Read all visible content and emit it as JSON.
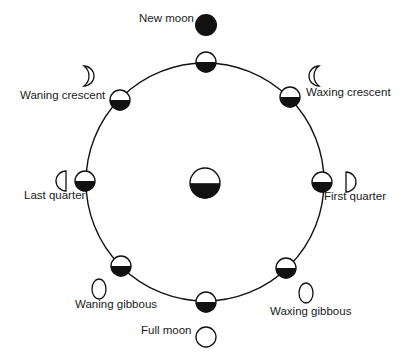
{
  "diagram": {
    "orbit": {
      "cx": 205,
      "cy": 182,
      "r": 119
    },
    "earth": {
      "cx": 205,
      "cy": 183,
      "r": 15
    },
    "colors": {
      "ink": "#111111",
      "background": "#ffffff"
    },
    "phases": [
      {
        "id": "new-moon",
        "label": "New moon",
        "orbit_moon": [
          206,
          62
        ],
        "view": {
          "shape": "new",
          "x": 206,
          "y": 25
        },
        "label_pos": [
          139,
          19
        ]
      },
      {
        "id": "waxing-crescent",
        "label": "Waxing crescent",
        "orbit_moon": [
          290,
          97
        ],
        "view": {
          "shape": "waxing-crescent",
          "x": 315,
          "y": 76
        },
        "label_pos": [
          306,
          93
        ]
      },
      {
        "id": "first-quarter",
        "label": "First quarter",
        "orbit_moon": [
          322,
          182
        ],
        "view": {
          "shape": "first-quarter",
          "x": 350,
          "y": 182
        },
        "label_pos": [
          324,
          197
        ]
      },
      {
        "id": "waxing-gibbous",
        "label": "Waxing gibbous",
        "orbit_moon": [
          286,
          268
        ],
        "view": {
          "shape": "waxing-gibbous",
          "x": 306,
          "y": 293
        },
        "label_pos": [
          270,
          312
        ]
      },
      {
        "id": "full-moon",
        "label": "Full moon",
        "orbit_moon": [
          206,
          302
        ],
        "view": {
          "shape": "full",
          "x": 206,
          "y": 337
        },
        "label_pos": [
          141,
          331
        ]
      },
      {
        "id": "waning-gibbous",
        "label": "Waning gibbous",
        "orbit_moon": [
          121,
          266
        ],
        "view": {
          "shape": "waning-gibbous",
          "x": 99,
          "y": 289
        },
        "label_pos": [
          75,
          305
        ]
      },
      {
        "id": "last-quarter",
        "label": "Last quarter",
        "orbit_moon": [
          85,
          181
        ],
        "view": {
          "shape": "last-quarter",
          "x": 62,
          "y": 181
        },
        "label_pos": [
          24,
          196
        ]
      },
      {
        "id": "waning-crescent",
        "label": "Waning crescent",
        "orbit_moon": [
          120,
          100
        ],
        "view": {
          "shape": "waning-crescent",
          "x": 88,
          "y": 76
        },
        "label_pos": [
          20,
          96
        ]
      }
    ]
  }
}
